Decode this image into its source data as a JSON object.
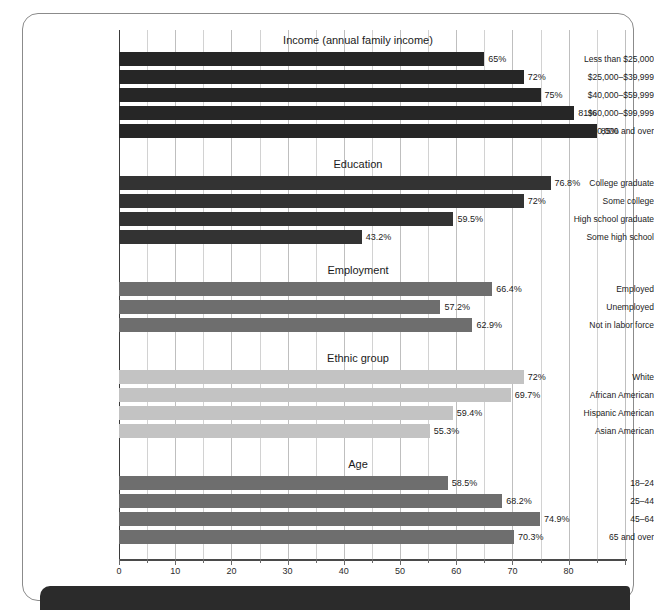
{
  "chart_data": {
    "type": "bar",
    "orientation": "horizontal",
    "title": "",
    "xlabel": "",
    "ylabel": "",
    "xlim": [
      0,
      90
    ],
    "xticks": [
      0,
      10,
      20,
      30,
      40,
      50,
      60,
      70,
      80
    ],
    "xtick_labels": [
      "0",
      "10",
      "20",
      "30",
      "40",
      "50",
      "60",
      "70",
      "80"
    ],
    "minor_tick_step": 5,
    "grid": true,
    "legend": "none",
    "value_suffix": "%",
    "sections": [
      {
        "title": "Income (annual family income)",
        "color": "#262626",
        "categories": [
          "Less than $25,000",
          "$25,000–$39,999",
          "$40,000–$59,999",
          "$60,000–$99,999",
          "$100,000 and over"
        ],
        "values": [
          65,
          72,
          75,
          81,
          85
        ],
        "labels": [
          "65%",
          "72%",
          "75%",
          "81%",
          "85%"
        ]
      },
      {
        "title": "Education",
        "color": "#333333",
        "categories": [
          "College graduate",
          "Some college",
          "High school graduate",
          "Some high school"
        ],
        "values": [
          76.8,
          72,
          59.5,
          43.2
        ],
        "labels": [
          "76.8%",
          "72%",
          "59.5%",
          "43.2%"
        ]
      },
      {
        "title": "Employment",
        "color": "#6e6e6e",
        "categories": [
          "Employed",
          "Unemployed",
          "Not in labor force"
        ],
        "values": [
          66.4,
          57.2,
          62.9
        ],
        "labels": [
          "66.4%",
          "57.2%",
          "62.9%"
        ]
      },
      {
        "title": "Ethnic group",
        "color": "#c3c3c3",
        "categories": [
          "White",
          "African American",
          "Hispanic American",
          "Asian American"
        ],
        "values": [
          72,
          69.7,
          59.4,
          55.3
        ],
        "labels": [
          "72%",
          "69.7%",
          "59.4%",
          "55.3%"
        ]
      },
      {
        "title": "Age",
        "color": "#6e6e6e",
        "categories": [
          "18–24",
          "25–44",
          "45–64",
          "65 and over"
        ],
        "values": [
          58.5,
          68.2,
          74.9,
          70.3
        ],
        "labels": [
          "58.5%",
          "68.2%",
          "74.9%",
          "70.3%"
        ]
      }
    ]
  }
}
